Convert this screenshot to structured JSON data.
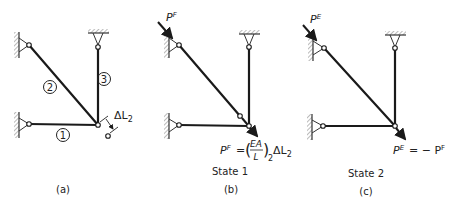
{
  "colors": {
    "ink": "#1a1a1a",
    "background": "#ffffff"
  },
  "panels": [
    {
      "id": "a",
      "caption": "(a)",
      "state_label": "",
      "members": [
        {
          "label": "1"
        },
        {
          "label": "2"
        },
        {
          "label": "3"
        }
      ],
      "annotation": "ΔL",
      "annotation_sub": "2"
    },
    {
      "id": "b",
      "caption": "(b)",
      "state_label": "State 1",
      "force_top": "P",
      "force_top_sup": "F",
      "equation": {
        "lhs": "P",
        "lhs_sup": "F",
        "eq": "=",
        "frac_num": "EA",
        "frac_den": "L",
        "sub": "2",
        "tail": "ΔL",
        "tail_sub": "2"
      }
    },
    {
      "id": "c",
      "caption": "(c)",
      "state_label": "State 2",
      "force_top": "P",
      "force_top_sup": "E",
      "equation": {
        "lhs": "P",
        "lhs_sup": "E",
        "rhs": "= − P",
        "rhs_sup": "F"
      }
    }
  ]
}
